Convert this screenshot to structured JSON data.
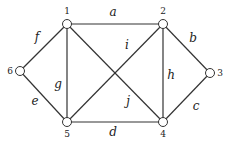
{
  "graph": {
    "nodes": [
      {
        "id": "1",
        "x": 67,
        "y": 24,
        "lx": 67,
        "ly": 14
      },
      {
        "id": "2",
        "x": 163,
        "y": 24,
        "lx": 163,
        "ly": 14
      },
      {
        "id": "3",
        "x": 210,
        "y": 73,
        "lx": 220,
        "ly": 76
      },
      {
        "id": "4",
        "x": 163,
        "y": 122,
        "lx": 163,
        "ly": 137
      },
      {
        "id": "5",
        "x": 67,
        "y": 122,
        "lx": 67,
        "ly": 137
      },
      {
        "id": "6",
        "x": 20,
        "y": 71,
        "lx": 10,
        "ly": 74
      }
    ],
    "edges": [
      {
        "label": "a",
        "from": "1",
        "to": "2",
        "lx": 113,
        "ly": 16
      },
      {
        "label": "b",
        "from": "2",
        "to": "3",
        "lx": 193,
        "ly": 42
      },
      {
        "label": "c",
        "from": "3",
        "to": "4",
        "lx": 196,
        "ly": 110
      },
      {
        "label": "d",
        "from": "4",
        "to": "5",
        "lx": 113,
        "ly": 136
      },
      {
        "label": "e",
        "from": "5",
        "to": "6",
        "lx": 35,
        "ly": 105
      },
      {
        "label": "f",
        "from": "6",
        "to": "1",
        "lx": 37,
        "ly": 41
      },
      {
        "label": "g",
        "from": "1",
        "to": "5",
        "lx": 58,
        "ly": 88
      },
      {
        "label": "h",
        "from": "2",
        "to": "4",
        "lx": 171,
        "ly": 79
      },
      {
        "label": "i",
        "from": "5",
        "to": "2",
        "lx": 127,
        "ly": 49
      },
      {
        "label": "j",
        "from": "1",
        "to": "4",
        "lx": 128,
        "ly": 105
      }
    ]
  }
}
